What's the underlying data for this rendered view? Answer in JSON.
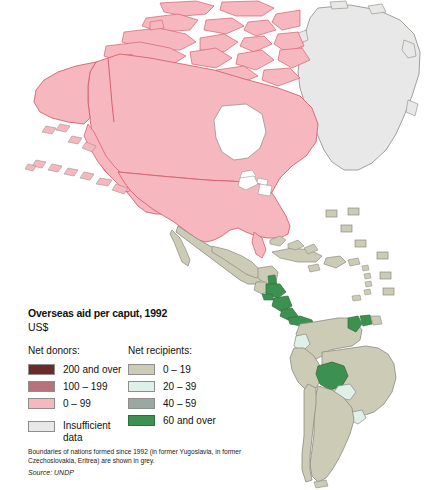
{
  "legend": {
    "title": "Overseas aid per caput, 1992",
    "subtitle": "US$",
    "donors_heading": "Net donors:",
    "recipients_heading": "Net recipients:",
    "donors": [
      {
        "label": "200 and over",
        "color": "#6b2b2b"
      },
      {
        "label": "100 – 199",
        "color": "#b5737b"
      },
      {
        "label": "0 – 99",
        "color": "#f6b7bf"
      }
    ],
    "insufficient": {
      "label": "Insufficient data",
      "color": "#e8e8e8"
    },
    "recipients": [
      {
        "label": "0 – 19",
        "color": "#cbcbb6"
      },
      {
        "label": "20 – 39",
        "color": "#dff0e8"
      },
      {
        "label": "40 – 59",
        "color": "#9aa8a2"
      },
      {
        "label": "60 and over",
        "color": "#3d9150"
      }
    ]
  },
  "footnote": {
    "text": "Boundaries of nations formed since 1992 (in former Yugoslavia, in former Czechoslovakia, Eritrea) are shown in grey.",
    "source": "Source: UNDP"
  },
  "map": {
    "background": "#ffffff",
    "outline_color": "#8a8a82",
    "donor_outline_color": "#d4626e",
    "regions": [
      {
        "name": "Canada",
        "category": "0 – 99",
        "color": "#f6b7bf"
      },
      {
        "name": "United States",
        "category": "0 – 99",
        "color": "#f6b7bf"
      },
      {
        "name": "Alaska",
        "category": "0 – 99",
        "color": "#f6b7bf"
      },
      {
        "name": "Canadian Arctic Islands",
        "category": "0 – 99",
        "color": "#f6b7bf"
      },
      {
        "name": "Greenland",
        "category": "Insufficient data",
        "color": "#e8e8e8"
      },
      {
        "name": "Mexico",
        "category": "0 – 19",
        "color": "#cbcbb6"
      },
      {
        "name": "Belize",
        "category": "60 and over",
        "color": "#3d9150"
      },
      {
        "name": "Guatemala",
        "category": "0 – 19",
        "color": "#cbcbb6"
      },
      {
        "name": "Honduras",
        "category": "60 and over",
        "color": "#3d9150"
      },
      {
        "name": "El Salvador",
        "category": "60 and over",
        "color": "#3d9150"
      },
      {
        "name": "Nicaragua",
        "category": "60 and over",
        "color": "#3d9150"
      },
      {
        "name": "Costa Rica",
        "category": "60 and over",
        "color": "#3d9150"
      },
      {
        "name": "Panama",
        "category": "60 and over",
        "color": "#3d9150"
      },
      {
        "name": "Cuba",
        "category": "0 – 19",
        "color": "#cbcbb6"
      },
      {
        "name": "Bahamas",
        "category": "0 – 19",
        "color": "#cbcbb6"
      },
      {
        "name": "Hispaniola",
        "category": "0 – 19",
        "color": "#cbcbb6"
      },
      {
        "name": "Jamaica",
        "category": "0 – 19",
        "color": "#cbcbb6"
      },
      {
        "name": "Puerto Rico",
        "category": "0 – 19",
        "color": "#cbcbb6"
      },
      {
        "name": "Lesser Antilles",
        "category": "0 – 19",
        "color": "#cbcbb6"
      },
      {
        "name": "Colombia",
        "category": "0 – 19",
        "color": "#cbcbb6"
      },
      {
        "name": "Venezuela",
        "category": "0 – 19",
        "color": "#cbcbb6"
      },
      {
        "name": "Guyana",
        "category": "60 and over",
        "color": "#3d9150"
      },
      {
        "name": "Suriname",
        "category": "60 and over",
        "color": "#3d9150"
      },
      {
        "name": "French Guiana",
        "category": "0 – 19",
        "color": "#cbcbb6"
      },
      {
        "name": "Ecuador",
        "category": "20 – 39",
        "color": "#dff0e8"
      },
      {
        "name": "Peru",
        "category": "0 – 19",
        "color": "#cbcbb6"
      },
      {
        "name": "Bolivia",
        "category": "60 and over",
        "color": "#3d9150"
      },
      {
        "name": "Brazil",
        "category": "0 – 19",
        "color": "#cbcbb6"
      },
      {
        "name": "Paraguay",
        "category": "20 – 39",
        "color": "#dff0e8"
      },
      {
        "name": "Uruguay",
        "category": "20 – 39",
        "color": "#dff0e8"
      },
      {
        "name": "Argentina",
        "category": "0 – 19",
        "color": "#cbcbb6"
      },
      {
        "name": "Chile",
        "category": "0 – 19",
        "color": "#cbcbb6"
      }
    ]
  }
}
